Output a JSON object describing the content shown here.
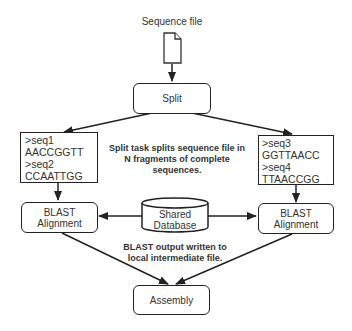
{
  "diagram": {
    "input": {
      "label": "Sequence file",
      "icon": "document-icon"
    },
    "split": {
      "label": "Split"
    },
    "split_note": {
      "line1": "Split task splits sequence file in",
      "line2": "N fragments of complete",
      "line3": "sequences."
    },
    "fragments": [
      {
        "lines": [
          ">seq1",
          "AACCGGTT",
          ">seq2",
          "CCAATTGG"
        ]
      },
      {
        "lines": [
          ">seq3",
          "GGTTAACC",
          ">seq4",
          "TTAACCGG"
        ]
      }
    ],
    "blast": [
      {
        "line1": "BLAST",
        "line2": "Alignment"
      },
      {
        "line1": "BLAST",
        "line2": "Alignment"
      }
    ],
    "database": {
      "line1": "Shared",
      "line2": "Database"
    },
    "blast_note": {
      "line1": "BLAST output written to",
      "line2": "local intermediate file."
    },
    "assembly": {
      "label": "Assembly"
    },
    "colors": {
      "stroke": "#222222",
      "text": "#333333",
      "background": "#ffffff"
    }
  }
}
